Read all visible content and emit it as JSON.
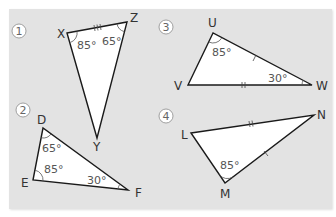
{
  "figure": {
    "background_color": "#e3e3e3",
    "triangle_fill": "#ffffff",
    "stroke_color": "#1a1a1a",
    "triangles": [
      {
        "number": "1",
        "vertices": {
          "a": {
            "label": "X",
            "x": 67,
            "y": 33
          },
          "b": {
            "label": "Z",
            "x": 127,
            "y": 22
          },
          "c": {
            "label": "Y",
            "x": 97,
            "y": 138
          }
        },
        "angles": [
          {
            "vertex": "X",
            "value": "85°"
          },
          {
            "vertex": "Z",
            "value": "65°"
          }
        ],
        "tick_marks": [
          {
            "side": "XZ",
            "count": 3
          }
        ]
      },
      {
        "number": "2",
        "vertices": {
          "a": {
            "label": "D",
            "x": 43,
            "y": 128
          },
          "b": {
            "label": "E",
            "x": 33,
            "y": 180
          },
          "c": {
            "label": "F",
            "x": 128,
            "y": 190
          }
        },
        "angles": [
          {
            "vertex": "D",
            "value": "65°"
          },
          {
            "vertex": "E",
            "value": "85°"
          },
          {
            "vertex": "F",
            "value": "30°"
          }
        ],
        "tick_marks": []
      },
      {
        "number": "3",
        "vertices": {
          "a": {
            "label": "U",
            "x": 213,
            "y": 33
          },
          "b": {
            "label": "V",
            "x": 188,
            "y": 85
          },
          "c": {
            "label": "W",
            "x": 312,
            "y": 85
          }
        },
        "angles": [
          {
            "vertex": "U",
            "value": "85°"
          },
          {
            "vertex": "W",
            "value": "30°"
          }
        ],
        "tick_marks": [
          {
            "side": "UW",
            "count": 1
          },
          {
            "side": "VW",
            "count": 2
          }
        ]
      },
      {
        "number": "4",
        "vertices": {
          "a": {
            "label": "L",
            "x": 191,
            "y": 133
          },
          "b": {
            "label": "N",
            "x": 314,
            "y": 115
          },
          "c": {
            "label": "M",
            "x": 225,
            "y": 183
          }
        },
        "angles": [
          {
            "vertex": "M",
            "value": "85°"
          }
        ],
        "tick_marks": [
          {
            "side": "LN",
            "count": 2
          },
          {
            "side": "MN",
            "count": 1
          }
        ]
      }
    ]
  }
}
